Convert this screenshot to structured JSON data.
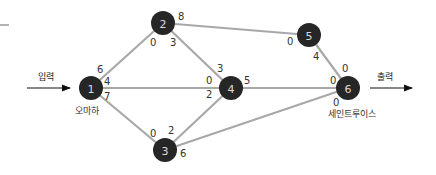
{
  "diagram": {
    "input_label": "입력",
    "output_label": "출력",
    "nodes": [
      {
        "id": "1",
        "label": "1",
        "caption": "오마하"
      },
      {
        "id": "2",
        "label": "2"
      },
      {
        "id": "3",
        "label": "3"
      },
      {
        "id": "4",
        "label": "4"
      },
      {
        "id": "5",
        "label": "5"
      },
      {
        "id": "6",
        "label": "6",
        "caption": "세인트루이스"
      }
    ],
    "edges": [
      {
        "from": "1",
        "to": "2",
        "cap_from": "6",
        "cap_to": "0"
      },
      {
        "from": "1",
        "to": "4",
        "cap_from": "4",
        "cap_to": "0"
      },
      {
        "from": "1",
        "to": "3",
        "cap_from": "7",
        "cap_to": "0"
      },
      {
        "from": "2",
        "to": "5",
        "cap_from": "8",
        "cap_to": "0"
      },
      {
        "from": "2",
        "to": "4",
        "cap_from": "3",
        "cap_to": "3"
      },
      {
        "from": "3",
        "to": "4",
        "cap_from": "2",
        "cap_to": "2"
      },
      {
        "from": "3",
        "to": "6",
        "cap_from": "6",
        "cap_to": "0"
      },
      {
        "from": "4",
        "to": "6",
        "cap_from": "5",
        "cap_to": "0"
      },
      {
        "from": "5",
        "to": "6",
        "cap_from": "4",
        "cap_to": "0"
      }
    ]
  }
}
